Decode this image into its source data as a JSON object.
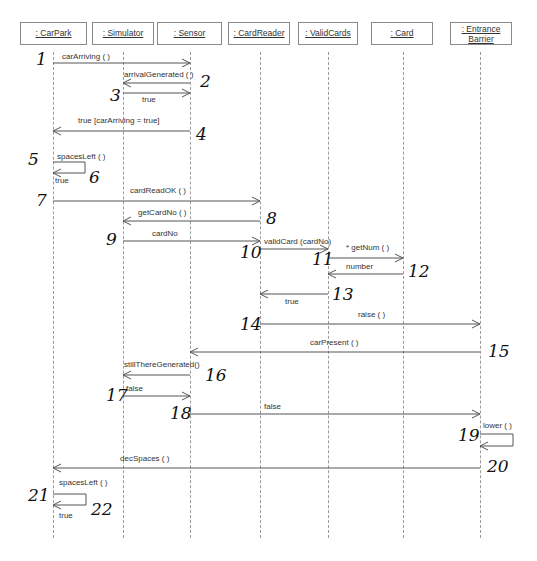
{
  "diagram": {
    "type": "UML sequence diagram",
    "objects": [
      {
        "id": "carpark",
        "label": ": CarPark",
        "x": 53
      },
      {
        "id": "simulator",
        "label": ": Simulator",
        "x": 123
      },
      {
        "id": "sensor",
        "label": ": Sensor",
        "x": 190
      },
      {
        "id": "cardreader",
        "label": ": CardReader",
        "x": 260
      },
      {
        "id": "validcards",
        "label": ": ValidCards",
        "x": 328
      },
      {
        "id": "card",
        "label": ": Card",
        "x": 403
      },
      {
        "id": "entrancebarrier",
        "label_line1": ": Entrance",
        "label_line2": "Barrier",
        "x": 480
      }
    ],
    "messages": [
      {
        "step": 1,
        "label": "carArriving ( )",
        "from": "carpark",
        "to": "sensor"
      },
      {
        "step": 2,
        "label": "arrivalGenerated ( )",
        "from": "sensor",
        "to": "simulator"
      },
      {
        "step": 3,
        "label": "true",
        "from": "simulator",
        "to": "sensor"
      },
      {
        "step": 4,
        "label": "true [carArriving = true]",
        "from": "sensor",
        "to": "carpark"
      },
      {
        "step": 5,
        "label": "spacesLeft ( )",
        "from": "carpark",
        "to": "carpark"
      },
      {
        "step": 6,
        "label": "true",
        "from": "carpark",
        "to": "carpark"
      },
      {
        "step": 7,
        "label": "cardReadOK ( )",
        "from": "carpark",
        "to": "cardreader"
      },
      {
        "step": 8,
        "label": "getCardNo ( )",
        "from": "cardreader",
        "to": "simulator"
      },
      {
        "step": 9,
        "label": "cardNo",
        "from": "simulator",
        "to": "cardreader"
      },
      {
        "step": 10,
        "label": "validCard (cardNo)",
        "from": "cardreader",
        "to": "validcards"
      },
      {
        "step": 11,
        "label": "* getNum ( )",
        "from": "validcards",
        "to": "card"
      },
      {
        "step": 12,
        "label": "number",
        "from": "card",
        "to": "validcards"
      },
      {
        "step": 13,
        "label": "true",
        "from": "validcards",
        "to": "cardreader"
      },
      {
        "step": 14,
        "label": "raise ( )",
        "from": "cardreader",
        "to": "entrancebarrier"
      },
      {
        "step": 15,
        "label": "carPresent ( )",
        "from": "entrancebarrier",
        "to": "sensor"
      },
      {
        "step": 16,
        "label": "stillThereGenerated()",
        "from": "sensor",
        "to": "simulator"
      },
      {
        "step": 17,
        "label": "false",
        "from": "simulator",
        "to": "sensor"
      },
      {
        "step": 18,
        "label": "false",
        "from": "sensor",
        "to": "entrancebarrier"
      },
      {
        "step": 19,
        "label": "lower ( )",
        "from": "entrancebarrier",
        "to": "entrancebarrier"
      },
      {
        "step": 20,
        "label": "decSpaces ( )",
        "from": "entrancebarrier",
        "to": "carpark"
      },
      {
        "step": 21,
        "label": "spacesLeft ( )",
        "from": "carpark",
        "to": "carpark"
      },
      {
        "step": 22,
        "label": "true",
        "from": "carpark",
        "to": "carpark"
      }
    ],
    "annotations": [
      "1",
      "2",
      "3",
      "4",
      "5",
      "6",
      "7",
      "8",
      "9",
      "10",
      "11",
      "12",
      "13",
      "14",
      "15",
      "16",
      "17",
      "18",
      "19",
      "20",
      "21",
      "22"
    ]
  }
}
